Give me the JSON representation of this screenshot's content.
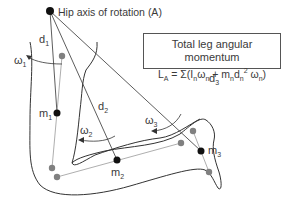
{
  "diagram": {
    "hip_label": "Hip axis of rotation (A)",
    "box": {
      "title": "Total leg angular momentum",
      "formula": {
        "lhs": "L",
        "lhs_sub": "A",
        "eq": " = Σ(I",
        "sub_n1": "n",
        "omega1": "ω",
        "sub_n2": "n",
        "plus": " + m",
        "sub_n3": "n",
        "d": "d",
        "sub_n4": "n",
        "sup2": "2",
        "omega2": " ω",
        "sub_n5": "n",
        "close": ")"
      }
    },
    "labels": {
      "d1": "d",
      "d1_sub": "1",
      "d2": "d",
      "d2_sub": "2",
      "d3": "d",
      "d3_sub": "3",
      "w1": "ω",
      "w1_sub": "1",
      "w2": "ω",
      "w2_sub": "2",
      "w3": "ω",
      "w3_sub": "3",
      "m1": "m",
      "m1_sub": "1",
      "m2": "m",
      "m2_sub": "2",
      "m3": "m",
      "m3_sub": "3"
    },
    "colors": {
      "outline": "#333333",
      "mass_point": "#111111",
      "joint_point": "#808080",
      "segment_line": "#999999"
    }
  }
}
